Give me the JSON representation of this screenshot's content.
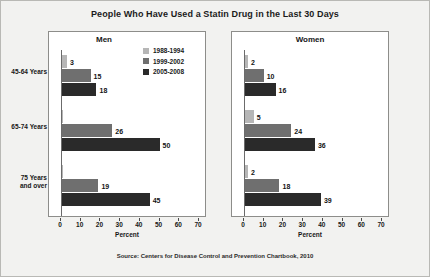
{
  "chart_data": {
    "type": "bar",
    "title": "People Who Have Used a Statin Drug in the Last 30 Days",
    "orientation": "horizontal",
    "panels": [
      {
        "name": "Men",
        "categories": [
          "45-64 Years",
          "65-74 Years",
          "75 Years and over"
        ],
        "series": [
          {
            "name": "1988-1994",
            "color": "#b6b6b6",
            "values": [
              3,
              0,
              0
            ],
            "labels": [
              "3",
              "",
              ""
            ]
          },
          {
            "name": "1999-2002",
            "color": "#6f6f6f",
            "values": [
              15,
              26,
              19
            ],
            "labels": [
              "15",
              "26",
              "19"
            ]
          },
          {
            "name": "2005-2008",
            "color": "#2a2a2a",
            "values": [
              18,
              50,
              45
            ],
            "labels": [
              "18",
              "50",
              "45"
            ]
          }
        ]
      },
      {
        "name": "Women",
        "categories": [
          "45-64 Years",
          "65-74 Years",
          "75 Years and over"
        ],
        "series": [
          {
            "name": "1988-1994",
            "color": "#b6b6b6",
            "values": [
              2,
              5,
              2
            ],
            "labels": [
              "2",
              "5",
              "2"
            ]
          },
          {
            "name": "1999-2002",
            "color": "#6f6f6f",
            "values": [
              10,
              24,
              18
            ],
            "labels": [
              "10",
              "24",
              "18"
            ]
          },
          {
            "name": "2005-2008",
            "color": "#2a2a2a",
            "values": [
              16,
              36,
              39
            ],
            "labels": [
              "16",
              "36",
              "39"
            ]
          }
        ]
      }
    ],
    "categories": [
      "45-64 Years",
      "65-74 Years",
      "75 Years and over"
    ],
    "category_lines": [
      [
        "45-64 Years"
      ],
      [
        "65-74 Years"
      ],
      [
        "75 Years",
        "and over"
      ]
    ],
    "legend": {
      "position": "top-right-inside-men-panel",
      "entries": [
        {
          "label": "1988-1994",
          "color": "#b6b6b6"
        },
        {
          "label": "1999-2002",
          "color": "#6f6f6f"
        },
        {
          "label": "2005-2008",
          "color": "#2a2a2a"
        }
      ]
    },
    "xlabel": "Percent",
    "ylabel": "",
    "xlim": [
      0,
      70
    ],
    "xticks": [
      0,
      10,
      20,
      30,
      40,
      50,
      60,
      70
    ],
    "xtick_labels": [
      "0",
      "10",
      "20",
      "30",
      "40",
      "50",
      "60",
      "70"
    ],
    "grid": false,
    "source": "Source: Centers for Disease Control and Prevention Chartbook, 2010"
  }
}
